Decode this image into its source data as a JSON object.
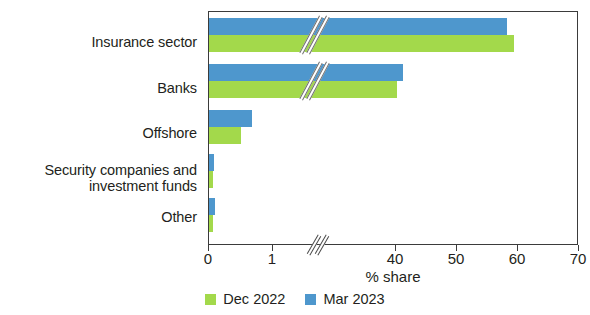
{
  "chart_data": {
    "type": "bar",
    "orientation": "horizontal",
    "title": "",
    "xlabel": "% share",
    "ylabel": "",
    "categories": [
      "Insurance sector",
      "Banks",
      "Offshore",
      "Security companies and\ninvestment funds",
      "Other"
    ],
    "series": [
      {
        "name": "Dec 2022",
        "color": "#a3d94b",
        "values": [
          59.3,
          40.2,
          0.5,
          0.07,
          0.06
        ]
      },
      {
        "name": "Mar 2023",
        "color": "#4e97cd",
        "values": [
          58.2,
          41.2,
          0.67,
          0.08,
          0.1
        ]
      }
    ],
    "xticks": [
      0,
      1,
      40,
      50,
      60,
      70
    ],
    "xticklabels": [
      "0",
      "1",
      "40",
      "50",
      "60",
      "70"
    ],
    "xlim": [
      0,
      70
    ],
    "axis_break": {
      "present": true,
      "after": 1,
      "before": 40,
      "note": "broken x axis between 1 and 40"
    },
    "grid": false,
    "legend_position": "bottom"
  },
  "legend": {
    "items": [
      {
        "label": "Dec 2022",
        "color": "#a3d94b"
      },
      {
        "label": "Mar 2023",
        "color": "#4e97cd"
      }
    ]
  },
  "axis": {
    "xlabel": "% share"
  }
}
